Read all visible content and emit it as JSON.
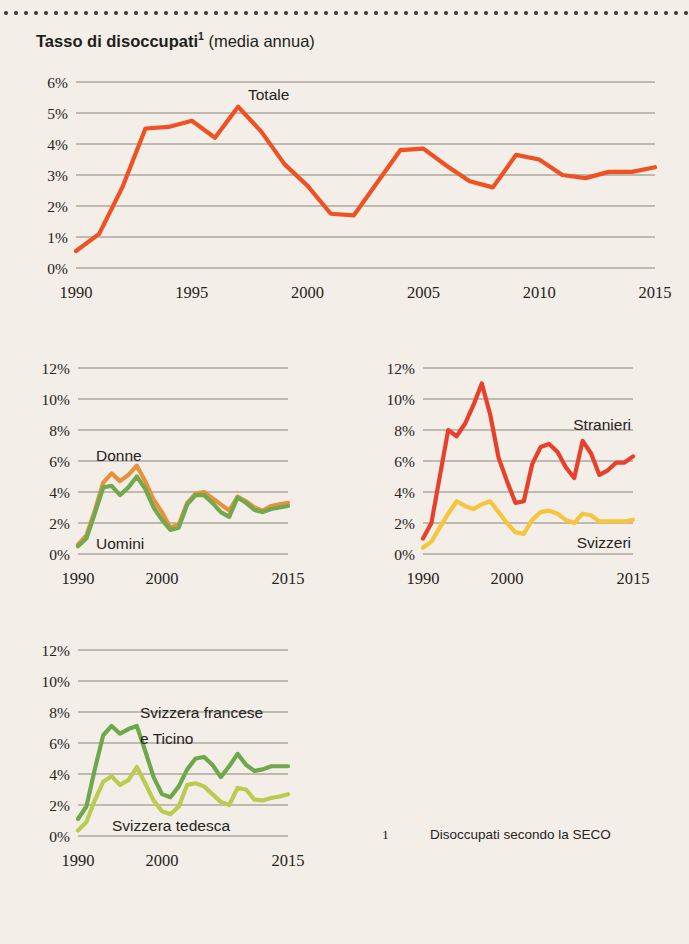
{
  "page": {
    "background_color": "#f3eee7",
    "title_main": "Tasso di disoccupati",
    "title_superscript": "1",
    "title_suffix": " (media annua)",
    "footnote_marker": "1",
    "footnote_text": "Disoccupati secondo la SECO"
  },
  "colors": {
    "totale": "#ef5123",
    "donne": "#e8913c",
    "uomini": "#72a94e",
    "stranieri": "#e8402a",
    "svizzeri": "#f6c53c",
    "svizzera_francese_ticino": "#6fa84b",
    "svizzera_tedesca": "#b9cc4f",
    "gridline": "#8a857c",
    "text": "#262320"
  },
  "chart_data": [
    {
      "id": "totale",
      "type": "line",
      "title": "Totale",
      "xlabel": "",
      "ylabel": "",
      "xlim": [
        1990,
        2015
      ],
      "ylim": [
        0,
        6
      ],
      "grid": true,
      "ytick_labels": [
        "6%",
        "5%",
        "4%",
        "3%",
        "2%",
        "1%",
        "0%"
      ],
      "ytick_values": [
        6,
        5,
        4,
        3,
        2,
        1,
        0
      ],
      "xtick_labels": [
        "1990",
        "1995",
        "2000",
        "2005",
        "2010",
        "2015"
      ],
      "xtick_values": [
        1990,
        1995,
        2000,
        2005,
        2010,
        2015
      ],
      "x": [
        1990,
        1991,
        1992,
        1993,
        1994,
        1995,
        1996,
        1997,
        1998,
        1999,
        2000,
        2001,
        2002,
        2003,
        2004,
        2005,
        2006,
        2007,
        2008,
        2009,
        2010,
        2011,
        2012,
        2013,
        2014,
        2015
      ],
      "series": [
        {
          "name": "Totale",
          "color": "#ef5123",
          "label_position": "top-center",
          "values": [
            0.55,
            1.1,
            2.6,
            4.5,
            4.55,
            4.75,
            4.2,
            5.2,
            4.4,
            3.35,
            2.65,
            1.75,
            1.7,
            2.75,
            3.8,
            3.85,
            3.3,
            2.8,
            2.6,
            3.65,
            3.5,
            3.0,
            2.9,
            3.1,
            3.1,
            3.25
          ]
        }
      ]
    },
    {
      "id": "sesso",
      "type": "line",
      "title": "",
      "xlim": [
        1990,
        2015
      ],
      "ylim": [
        0,
        12
      ],
      "grid": true,
      "ytick_labels": [
        "12%",
        "10%",
        "8%",
        "6%",
        "4%",
        "2%",
        "0%"
      ],
      "ytick_values": [
        12,
        10,
        8,
        6,
        4,
        2,
        0
      ],
      "xtick_labels": [
        "1990",
        "2000",
        "2015"
      ],
      "xtick_values": [
        1990,
        2000,
        2015
      ],
      "x": [
        1990,
        1991,
        1992,
        1993,
        1994,
        1995,
        1996,
        1997,
        1998,
        1999,
        2000,
        2001,
        2002,
        2003,
        2004,
        2005,
        2006,
        2007,
        2008,
        2009,
        2010,
        2011,
        2012,
        2013,
        2014,
        2015
      ],
      "series": [
        {
          "name": "Donne",
          "color": "#e8913c",
          "label_position": "upper-left",
          "values": [
            0.6,
            1.2,
            2.8,
            4.6,
            5.2,
            4.7,
            5.1,
            5.7,
            4.7,
            3.5,
            2.7,
            1.7,
            1.9,
            3.3,
            3.9,
            4.0,
            3.6,
            3.2,
            2.8,
            3.7,
            3.4,
            3.0,
            2.8,
            3.1,
            3.2,
            3.3
          ]
        },
        {
          "name": "Uomini",
          "color": "#72a94e",
          "label_position": "lower-left",
          "values": [
            0.5,
            1.0,
            2.6,
            4.3,
            4.4,
            3.8,
            4.3,
            5.0,
            4.2,
            3.0,
            2.2,
            1.55,
            1.7,
            3.2,
            3.8,
            3.8,
            3.3,
            2.7,
            2.4,
            3.65,
            3.3,
            2.85,
            2.7,
            2.9,
            3.0,
            3.1
          ]
        }
      ]
    },
    {
      "id": "nazionalita",
      "type": "line",
      "title": "",
      "xlim": [
        1990,
        2015
      ],
      "ylim": [
        0,
        12
      ],
      "grid": true,
      "ytick_labels": [
        "12%",
        "10%",
        "8%",
        "6%",
        "4%",
        "2%",
        "0%"
      ],
      "ytick_values": [
        12,
        10,
        8,
        6,
        4,
        2,
        0
      ],
      "xtick_labels": [
        "1990",
        "2000",
        "2015"
      ],
      "xtick_values": [
        1990,
        2000,
        2015
      ],
      "x": [
        1990,
        1991,
        1992,
        1993,
        1994,
        1995,
        1996,
        1997,
        1998,
        1999,
        2000,
        2001,
        2002,
        2003,
        2004,
        2005,
        2006,
        2007,
        2008,
        2009,
        2010,
        2011,
        2012,
        2013,
        2014,
        2015
      ],
      "series": [
        {
          "name": "Stranieri",
          "color": "#e8402a",
          "label_position": "upper-right",
          "values": [
            1.0,
            2.0,
            5.0,
            8.0,
            7.6,
            8.4,
            9.6,
            11.0,
            9.0,
            6.2,
            4.7,
            3.3,
            3.4,
            5.8,
            6.9,
            7.1,
            6.6,
            5.6,
            4.9,
            7.3,
            6.5,
            5.1,
            5.4,
            5.9,
            5.9,
            6.3
          ]
        },
        {
          "name": "Svizzeri",
          "color": "#f6c53c",
          "label_position": "lower-right",
          "values": [
            0.4,
            0.8,
            1.7,
            2.6,
            3.4,
            3.1,
            2.9,
            3.2,
            3.4,
            2.7,
            2.0,
            1.4,
            1.3,
            2.2,
            2.7,
            2.8,
            2.6,
            2.2,
            2.0,
            2.6,
            2.5,
            2.1,
            2.1,
            2.1,
            2.1,
            2.2
          ]
        }
      ]
    },
    {
      "id": "regioni",
      "type": "line",
      "title": "",
      "xlim": [
        1990,
        2015
      ],
      "ylim": [
        0,
        12
      ],
      "grid": true,
      "ytick_labels": [
        "12%",
        "10%",
        "8%",
        "6%",
        "4%",
        "2%",
        "0%"
      ],
      "ytick_values": [
        12,
        10,
        8,
        6,
        4,
        2,
        0
      ],
      "xtick_labels": [
        "1990",
        "2000",
        "2015"
      ],
      "xtick_values": [
        1990,
        2000,
        2015
      ],
      "x": [
        1990,
        1991,
        1992,
        1993,
        1994,
        1995,
        1996,
        1997,
        1998,
        1999,
        2000,
        2001,
        2002,
        2003,
        2004,
        2005,
        2006,
        2007,
        2008,
        2009,
        2010,
        2011,
        2012,
        2013,
        2014,
        2015
      ],
      "series": [
        {
          "name": "Svizzera francese e Ticino",
          "name_line1": "Svizzera francese",
          "name_line2": "e Ticino",
          "color": "#6fa84b",
          "label_position": "upper-center",
          "values": [
            1.1,
            1.9,
            4.3,
            6.5,
            7.1,
            6.6,
            6.9,
            7.1,
            5.5,
            3.8,
            2.7,
            2.5,
            3.2,
            4.3,
            5.0,
            5.1,
            4.6,
            3.8,
            4.5,
            5.3,
            4.6,
            4.2,
            4.3,
            4.5,
            4.5,
            4.5
          ]
        },
        {
          "name": "Svizzera tedesca",
          "color": "#b9cc4f",
          "label_position": "bottom-center",
          "values": [
            0.35,
            0.9,
            2.3,
            3.5,
            3.85,
            3.3,
            3.6,
            4.45,
            3.4,
            2.3,
            1.6,
            1.4,
            1.9,
            3.3,
            3.4,
            3.2,
            2.7,
            2.2,
            2.0,
            3.1,
            3.0,
            2.35,
            2.3,
            2.45,
            2.55,
            2.7
          ]
        }
      ]
    }
  ]
}
